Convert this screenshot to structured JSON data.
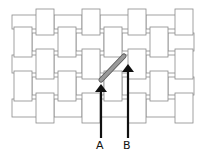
{
  "diagram": {
    "type": "plain weave illustration",
    "stroke_color": "#8a8a8a",
    "fill_color": "#ffffff",
    "highlight_color": "#9a9a9a",
    "arrow_color": "#111111",
    "rows": [
      {
        "y": 13,
        "h": 18,
        "cells": [
          {
            "x": 12,
            "w": 26,
            "o": "h"
          },
          {
            "x": 36,
            "w": 18,
            "o": "v"
          },
          {
            "x": 54,
            "w": 28,
            "o": "h"
          },
          {
            "x": 82,
            "w": 18,
            "o": "v"
          },
          {
            "x": 100,
            "w": 30,
            "o": "h"
          },
          {
            "x": 128,
            "w": 18,
            "o": "v"
          },
          {
            "x": 146,
            "w": 30,
            "o": "h"
          },
          {
            "x": 175,
            "w": 18,
            "o": "v"
          }
        ]
      },
      {
        "y": 31,
        "h": 22,
        "cells": [
          {
            "x": 14,
            "w": 18,
            "o": "v"
          },
          {
            "x": 32,
            "w": 28,
            "o": "h"
          },
          {
            "x": 58,
            "w": 18,
            "o": "v"
          },
          {
            "x": 76,
            "w": 28,
            "o": "h"
          },
          {
            "x": 104,
            "w": 18,
            "o": "v"
          },
          {
            "x": 122,
            "w": 30,
            "o": "h"
          },
          {
            "x": 150,
            "w": 18,
            "o": "v"
          },
          {
            "x": 168,
            "w": 26,
            "o": "h"
          }
        ]
      },
      {
        "y": 53,
        "h": 22,
        "cells": [
          {
            "x": 12,
            "w": 26,
            "o": "h"
          },
          {
            "x": 36,
            "w": 18,
            "o": "v"
          },
          {
            "x": 54,
            "w": 28,
            "o": "h"
          },
          {
            "x": 82,
            "w": 18,
            "o": "v"
          },
          {
            "x": 100,
            "w": 30,
            "o": "h"
          },
          {
            "x": 128,
            "w": 18,
            "o": "v"
          },
          {
            "x": 146,
            "w": 30,
            "o": "h"
          },
          {
            "x": 175,
            "w": 18,
            "o": "v"
          }
        ]
      },
      {
        "y": 75,
        "h": 22,
        "cells": [
          {
            "x": 14,
            "w": 18,
            "o": "v"
          },
          {
            "x": 32,
            "w": 28,
            "o": "h"
          },
          {
            "x": 58,
            "w": 18,
            "o": "v"
          },
          {
            "x": 76,
            "w": 28,
            "o": "h"
          },
          {
            "x": 104,
            "w": 18,
            "o": "v"
          },
          {
            "x": 122,
            "w": 30,
            "o": "h"
          },
          {
            "x": 150,
            "w": 18,
            "o": "v"
          },
          {
            "x": 168,
            "w": 26,
            "o": "h"
          }
        ]
      },
      {
        "y": 97,
        "h": 22,
        "cells": [
          {
            "x": 12,
            "w": 26,
            "o": "h"
          },
          {
            "x": 36,
            "w": 18,
            "o": "v"
          },
          {
            "x": 54,
            "w": 28,
            "o": "h"
          },
          {
            "x": 82,
            "w": 18,
            "o": "v"
          },
          {
            "x": 100,
            "w": 30,
            "o": "h"
          },
          {
            "x": 128,
            "w": 18,
            "o": "v"
          },
          {
            "x": 146,
            "w": 30,
            "o": "h"
          },
          {
            "x": 175,
            "w": 18,
            "o": "v"
          }
        ]
      }
    ],
    "highlight": {
      "x1": 101,
      "y1": 80,
      "x2": 124,
      "y2": 56
    },
    "arrows": [
      {
        "label": "A",
        "x": 101,
        "y_top": 84,
        "y_bottom": 138
      },
      {
        "label": "B",
        "x": 128,
        "y_top": 64,
        "y_bottom": 138
      }
    ]
  }
}
